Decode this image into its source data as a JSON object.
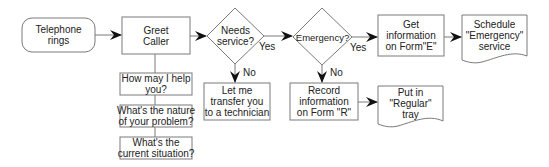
{
  "colors": {
    "stroke": "#7a7a7a",
    "arrow": "#111111",
    "text": "#222222",
    "background": "#ffffff"
  },
  "nodes": {
    "start": {
      "shape": "rounded-rectangle",
      "label": "Telephone\nrings"
    },
    "greet": {
      "shape": "rectangle",
      "label": "Greet\nCaller"
    },
    "q1": {
      "shape": "rectangle",
      "label": "How may I help\nyou?"
    },
    "q2": {
      "shape": "rectangle",
      "label": "What's the nature\nof your problem?"
    },
    "q3": {
      "shape": "rectangle",
      "label": "What's the\ncurrent situation?"
    },
    "needs_service": {
      "shape": "diamond",
      "label": "Needs\nservice?"
    },
    "transfer": {
      "shape": "rectangle",
      "label": "Let me\ntransfer you\nto a technician"
    },
    "emergency": {
      "shape": "diamond",
      "label": "Emergency?"
    },
    "record_r": {
      "shape": "rectangle",
      "label": "Record\ninformation\non Form \"R\""
    },
    "regular_tray": {
      "shape": "document",
      "label": "Put in\n\"Regular\"\ntray"
    },
    "form_e": {
      "shape": "rectangle",
      "label": "Get\ninformation\non Form\"E\""
    },
    "schedule": {
      "shape": "document",
      "label": "Schedule\n\"Emergency\"\nservice"
    }
  },
  "edge_labels": {
    "needs_yes": "Yes",
    "needs_no": "No",
    "emergency_yes": "Yes",
    "emergency_no": "No"
  }
}
